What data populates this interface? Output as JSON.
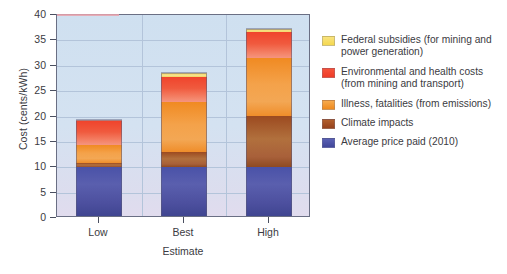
{
  "chart_data": {
    "type": "bar",
    "title": "",
    "subtitle": "",
    "xlabel": "Estimate",
    "ylabel": "Cost (cents/kWh)",
    "categories": [
      "Low",
      "Best",
      "High"
    ],
    "ylim": [
      0,
      40
    ],
    "yticks": [
      0,
      5,
      10,
      15,
      20,
      25,
      30,
      35,
      40
    ],
    "ytick_labels": [
      "0",
      "5",
      "10",
      "15",
      "20",
      "25",
      "30",
      "35",
      "40"
    ],
    "grid": true,
    "stacked": true,
    "legend_position": "right",
    "series": [
      {
        "name": "Average price paid (2010)",
        "color": "#4a52a8",
        "values": [
          9.6,
          9.6,
          9.6
        ]
      },
      {
        "name": "Climate impacts",
        "color": "#9c4a20",
        "values": [
          0.8,
          3.0,
          10.1
        ]
      },
      {
        "name": "Illness, fatalities (from emissions)",
        "color": "#f08a22",
        "values": [
          3.5,
          9.8,
          11.4
        ]
      },
      {
        "name": "Environmental and health costs (from mining and transport)",
        "color": "#f0442c",
        "values": [
          5.0,
          5.0,
          5.1
        ]
      },
      {
        "name": "Federal subsidies (for mining and power generation)",
        "color": "#f7dc6b",
        "values": [
          0.0,
          0.7,
          0.7
        ]
      }
    ],
    "totals": [
      18.9,
      28.1,
      36.9
    ]
  },
  "axis": {
    "y_title": "Cost (cents/kWh)",
    "x_title": "Estimate",
    "y_ticks": [
      "40",
      "35",
      "30",
      "25",
      "20",
      "15",
      "10",
      "5",
      "0"
    ],
    "x_ticks": [
      "Low",
      "Best",
      "High"
    ]
  },
  "legend": {
    "items": [
      {
        "label": "Federal subsidies (for mining and power generation)",
        "color": "#f7dc6b"
      },
      {
        "label": "Environmental and health costs (from mining and transport)",
        "color": "#f0442c"
      },
      {
        "label": "Illness, fatalities (from emissions)",
        "color": "#f08a22"
      },
      {
        "label": "Climate impacts",
        "color": "#9c4a20"
      },
      {
        "label": "Average price paid (2010)",
        "color": "#4a52a8"
      }
    ]
  }
}
